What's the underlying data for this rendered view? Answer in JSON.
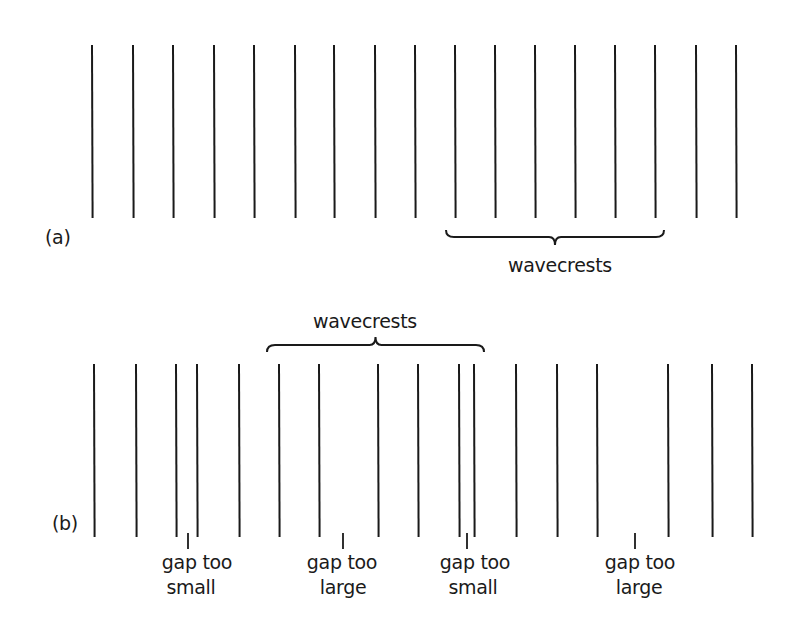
{
  "figure": {
    "stroke_color": "#1a1a1a",
    "background": "#ffffff"
  },
  "panel_a": {
    "label": "(a)",
    "line_top": 45,
    "line_bottom": 218,
    "lines_x": [
      92,
      133,
      173,
      214,
      254,
      295,
      334,
      375,
      415,
      455,
      495,
      535,
      575,
      615,
      655,
      696,
      736
    ],
    "brace": {
      "x1": 446,
      "x2": 664,
      "y": 237,
      "direction": "down",
      "label": "wavecrests"
    }
  },
  "panel_b": {
    "label": "(b)",
    "line_top": 364,
    "line_bottom": 537,
    "lines_x": [
      94,
      136,
      176,
      197,
      239,
      279,
      319,
      378,
      418,
      459,
      474,
      516,
      557,
      597,
      668,
      712,
      752
    ],
    "brace": {
      "x1": 267,
      "x2": 484,
      "y": 345,
      "direction": "up",
      "label": "wavecrests"
    },
    "annotations": [
      {
        "x": 188,
        "line1": "gap too",
        "line2": "small"
      },
      {
        "x": 343,
        "line1": "gap too",
        "line2": "large"
      },
      {
        "x": 467,
        "line1": "gap too",
        "line2": "small"
      },
      {
        "x": 635,
        "line1": "gap too",
        "line2": "large"
      }
    ]
  }
}
